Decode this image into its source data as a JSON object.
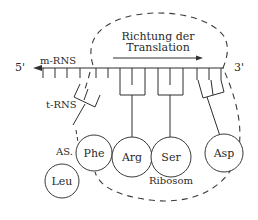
{
  "diagram": {
    "title_line1": "Richtung der",
    "title_line2": "Translation",
    "mrna_label": "m-RNS",
    "five_prime": "5'",
    "three_prime": "3'",
    "trna_label": "t-RNS",
    "aa_label": "AS.",
    "ribosome_label": "Ribosom",
    "amino_acids": [
      {
        "name": "Leu"
      },
      {
        "name": "Phe"
      },
      {
        "name": "Arg"
      },
      {
        "name": "Ser"
      },
      {
        "name": "Asp"
      }
    ],
    "colors": {
      "ink": "#2f2f2f",
      "background": "#ffffff"
    }
  }
}
